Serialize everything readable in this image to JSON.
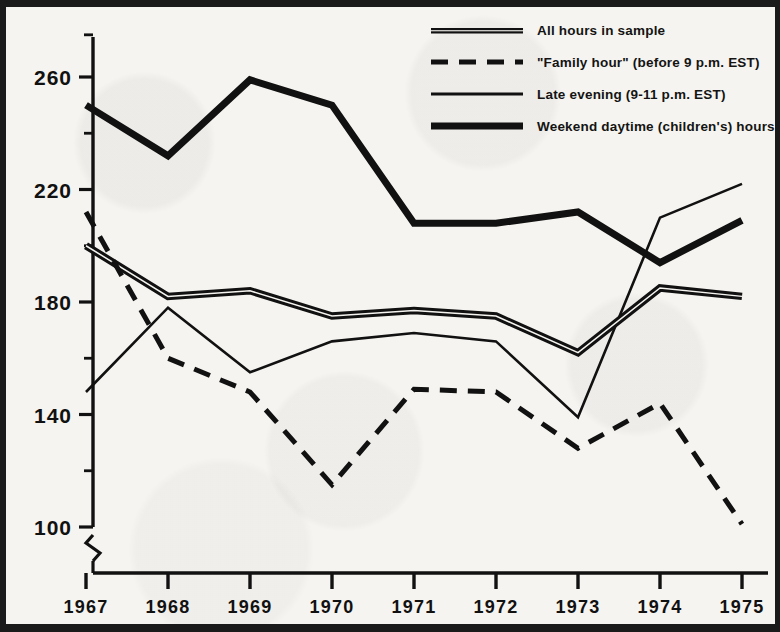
{
  "chart_data": {
    "type": "line",
    "title": "",
    "subtitle": "",
    "xlabel": "",
    "ylabel": "",
    "x": [
      1967,
      1968,
      1969,
      1970,
      1971,
      1972,
      1973,
      1974,
      1975
    ],
    "xtick_labels": [
      "1967",
      "1968",
      "1969",
      "1970",
      "1971",
      "1972",
      "1973",
      "1974",
      "1975"
    ],
    "ytick_labels": [
      "100",
      "140",
      "180",
      "220",
      "260"
    ],
    "ytick_values": [
      100,
      140,
      180,
      220,
      260
    ],
    "yminor_ticks": [
      120,
      160,
      200,
      240,
      275
    ],
    "ylim": [
      95,
      276
    ],
    "xlim": [
      1966.6,
      1975.6
    ],
    "axis_break": true,
    "grid": false,
    "legend_position": "top-right",
    "series": [
      {
        "name": "All hours in sample",
        "style": "double-thick-solid",
        "values": [
          200,
          182,
          184,
          175,
          177,
          175,
          162,
          185,
          182
        ]
      },
      {
        "name": "\"Family hour\" (before 9 p.m. EST)",
        "style": "dashed",
        "values": [
          212,
          160,
          148,
          115,
          149,
          148,
          128,
          144,
          101
        ]
      },
      {
        "name": "Late evening (9-11 p.m. EST)",
        "style": "thin-solid",
        "values": [
          148,
          178,
          155,
          166,
          169,
          166,
          139,
          210,
          222
        ]
      },
      {
        "name": "Weekend daytime (children's) hours",
        "style": "heavy-solid",
        "values": [
          200,
          182,
          184,
          175,
          177,
          175,
          162,
          194,
          209
        ]
      }
    ],
    "series_overlay": [
      {
        "name": "Weekend daytime (children's) hours",
        "note": "top curve",
        "values": [
          250,
          232,
          259,
          250,
          208,
          208,
          212,
          194,
          209
        ]
      }
    ]
  },
  "legend": {
    "items": [
      {
        "label": "All hours in sample",
        "swatch": "double-thick-solid-swatch"
      },
      {
        "label": "\"Family hour\" (before 9 p.m. EST)",
        "swatch": "dashed-swatch"
      },
      {
        "label": "Late evening (9-11 p.m. EST)",
        "swatch": "thin-solid-swatch"
      },
      {
        "label": "Weekend daytime (children's) hours",
        "swatch": "heavy-solid-swatch"
      }
    ]
  },
  "colors": {
    "ink": "#111111",
    "paper": "#f6f4f0",
    "frame": "#1a1a1a"
  }
}
